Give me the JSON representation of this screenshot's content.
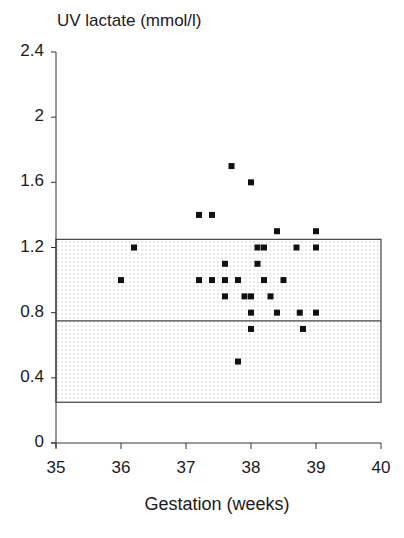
{
  "chart_data": {
    "type": "scatter",
    "title": "",
    "ylabel": "UV lactate (mmol/l)",
    "xlabel": "Gestation (weeks)",
    "xlim": [
      35,
      40
    ],
    "ylim": [
      0,
      2.4
    ],
    "xticks": [
      "35",
      "36",
      "37",
      "38",
      "39",
      "40"
    ],
    "yticks": [
      "0",
      "0.4",
      "0.8",
      "1.2",
      "1.6",
      "2",
      "2.4"
    ],
    "grid": false,
    "legend": null,
    "reference_band": {
      "lower": 0.25,
      "upper": 1.25,
      "median": 0.75,
      "fill": "stippled light gray"
    },
    "series": [
      {
        "name": "UV lactate",
        "marker": "square",
        "color": "#111111",
        "points": [
          [
            36.0,
            1.0
          ],
          [
            36.2,
            1.2
          ],
          [
            37.2,
            1.4
          ],
          [
            37.4,
            1.4
          ],
          [
            37.7,
            1.7
          ],
          [
            38.0,
            1.6
          ],
          [
            38.4,
            1.3
          ],
          [
            39.0,
            1.3
          ],
          [
            38.1,
            1.2
          ],
          [
            38.2,
            1.2
          ],
          [
            38.7,
            1.2
          ],
          [
            39.0,
            1.2
          ],
          [
            37.6,
            1.1
          ],
          [
            38.1,
            1.1
          ],
          [
            37.2,
            1.0
          ],
          [
            37.4,
            1.0
          ],
          [
            37.6,
            1.0
          ],
          [
            37.8,
            1.0
          ],
          [
            38.2,
            1.0
          ],
          [
            38.5,
            1.0
          ],
          [
            37.6,
            0.9
          ],
          [
            37.9,
            0.9
          ],
          [
            38.0,
            0.9
          ],
          [
            38.3,
            0.9
          ],
          [
            38.0,
            0.8
          ],
          [
            38.4,
            0.8
          ],
          [
            38.75,
            0.8
          ],
          [
            39.0,
            0.8
          ],
          [
            38.0,
            0.7
          ],
          [
            38.8,
            0.7
          ],
          [
            37.8,
            0.5
          ]
        ]
      }
    ]
  },
  "labels": {
    "y_title": "UV lactate (mmol/l)",
    "x_title": "Gestation (weeks)"
  }
}
